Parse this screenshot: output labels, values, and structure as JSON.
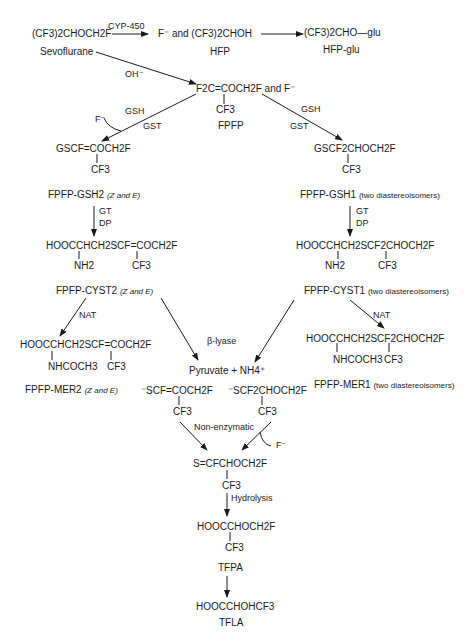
{
  "top": {
    "sevoflurane_formula": "(CF3)2CHOCH2F",
    "sevoflurane_name": "Sevoflurane",
    "cyp_label": "CYP-450",
    "hfp_formula": "F⁻ and (CF3)2CHOH",
    "hfp_name": "HFP",
    "hfp_glu_formula": "(CF3)2CHO—glu",
    "hfp_glu_name": "HFP-glu",
    "oh_label": "OH⁻"
  },
  "fpfp": {
    "formula": "F2C=COCH2F and F⁻",
    "branch": "CF3",
    "name": "FPFP",
    "left_gsh": "GSH",
    "left_gst": "GST",
    "left_f": "F⁻",
    "right_gsh": "GSH",
    "right_gst": "GST"
  },
  "gsh2": {
    "formula": "GSCF=COCH2F",
    "branch": "CF3",
    "name": "FPFP-GSH2",
    "isomers": "(Z and E)",
    "gt": "GT",
    "dp": "DP"
  },
  "gsh1": {
    "formula": "GSCF2CHOCH2F",
    "branch": "CF3",
    "name": "FPFP-GSH1",
    "isomers": "(two diastereoisomers)",
    "gt": "GT",
    "dp": "DP"
  },
  "cyst2": {
    "formula": "HOOCCHCH2SCF=COCH2F",
    "branch1": "NH2",
    "branch2": "CF3",
    "name": "FPFP-CYST2",
    "isomers": "(Z and E)",
    "nat": "NAT"
  },
  "cyst1": {
    "formula": "HOOCCHCH2SCF2CHOCH2F",
    "branch1": "NH2",
    "branch2": "CF3",
    "name": "FPFP-CYST1",
    "isomers": "(two diastereoisomers)",
    "nat": "NAT"
  },
  "mer2": {
    "formula": "HOOCCHCH2SCF=COCH2F",
    "branch1": "NHCOCH3",
    "branch2": "CF3",
    "name": "FPFP-MER2",
    "isomers": "(Z and E)"
  },
  "mer1": {
    "formula": "HOOCCHCH2SCF2CHOCH2F",
    "branch1": "NHCOCH3",
    "branch2": "CF3",
    "name": "FPFP-MER1",
    "isomers": "(two diastereoisomers)"
  },
  "lyase": {
    "label": "β-lyase",
    "products": "Pyruvate + NH4⁺"
  },
  "thiolates": {
    "left": "⁻SCF=COCH2F",
    "left_branch": "CF3",
    "right": "⁻SCF2CHOCH2F",
    "right_branch": "CF3",
    "nonenzymatic": "Non-enzymatic",
    "f_minus": "F⁻"
  },
  "thioacyl": {
    "formula": "S=CFCHOCH2F",
    "branch": "CF3",
    "hydrolysis": "Hydrolysis"
  },
  "tfpa": {
    "formula": "HOOCCHOCH2F",
    "branch": "CF3",
    "name": "TFPA"
  },
  "tfla": {
    "formula": "HOOCCHOHCF3",
    "name": "TFLA"
  }
}
